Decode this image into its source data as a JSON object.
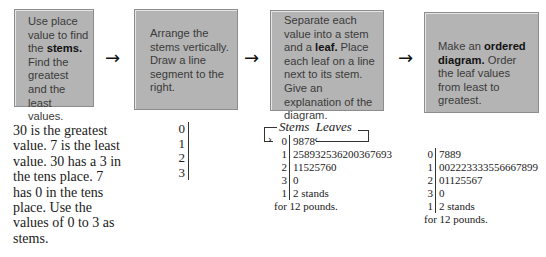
{
  "steps": [
    {
      "parts": [
        {
          "t": "Use place value to find the "
        },
        {
          "t": "stems.",
          "b": true
        },
        {
          "t": " Find the greatest and the least values."
        }
      ]
    },
    {
      "parts": [
        {
          "t": "Arrange the stems vertically. Draw a line segment to the right."
        }
      ]
    },
    {
      "parts": [
        {
          "t": "Separate each value into a stem and a "
        },
        {
          "t": "leaf.",
          "b": true
        },
        {
          "t": " Place each leaf on a line next to its stem. Give an explanation of the diagram."
        }
      ]
    },
    {
      "parts": [
        {
          "t": "Make an "
        },
        {
          "t": "ordered diagram.",
          "b": true
        },
        {
          "t": " Order the leaf values from least to greatest."
        }
      ]
    }
  ],
  "step1": {
    "prefix": "Use place value to find the ",
    "bold": "stems.",
    "suffix": " Find the greatest and the least values."
  },
  "step2": {
    "text": "Arrange the stems vertically. Draw a line segment to the right."
  },
  "step3": {
    "prefix": "Separate each value into a stem and a ",
    "bold": "leaf.",
    "suffix": " Place each leaf on a line next to its stem. Give an explanation of the diagram."
  },
  "step4": {
    "prefix": "Make an ",
    "bold": "ordered diagram.",
    "suffix": " Order the leaf values from least to greatest."
  },
  "arrow_glyph": "→",
  "explanation": "30 is the greatest value. 7 is the least value. 30 has a 3 in the tens place. 7 has 0 in the tens place. Use the values of 0 to 3 as stems.",
  "stems_only": [
    "0",
    "1",
    "2",
    "3"
  ],
  "unordered_plot": {
    "header": "Stems  Leaves",
    "rows": [
      {
        "stem": "0",
        "leaves": "9878"
      },
      {
        "stem": "1",
        "leaves": "258932536200367693"
      },
      {
        "stem": "2",
        "leaves": "11525760"
      },
      {
        "stem": "3",
        "leaves": "0"
      }
    ],
    "key_stem": "1",
    "key_leaf": "2 stands",
    "key_line2": "for 12 pounds."
  },
  "ordered_plot": {
    "rows": [
      {
        "stem": "0",
        "leaves": "7889"
      },
      {
        "stem": "1",
        "leaves": "002223333556667899"
      },
      {
        "stem": "2",
        "leaves": "01125567"
      },
      {
        "stem": "3",
        "leaves": "0"
      }
    ],
    "key_stem": "1",
    "key_leaf": "2 stands",
    "key_line2": "for 12 pounds."
  },
  "colors": {
    "box_fill": "#b4b4b4",
    "box_border": "#8c8c8c",
    "text": "#1a1a1a"
  }
}
